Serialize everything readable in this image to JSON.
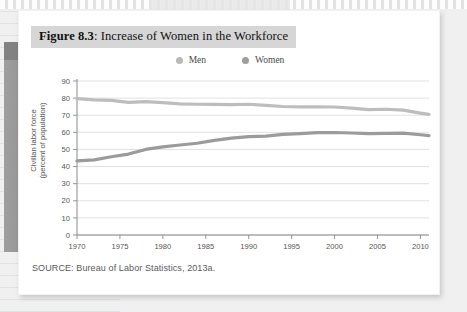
{
  "figure": {
    "number_label": "Figure 8.3",
    "separator": ": ",
    "title_text": "Increase of Women in the Workforce",
    "source": "SOURCE: Bureau of Labor Statistics, 2013a."
  },
  "legend": {
    "items": [
      {
        "label": "Men",
        "color": "#b9b9b9"
      },
      {
        "label": "Women",
        "color": "#9e9e9e"
      }
    ]
  },
  "colors": {
    "title_banner_bg": "#d6d6d6",
    "card_bg": "#ffffff",
    "page_bg": "#f0f0f0",
    "gridline": "#d9d9d9",
    "axis": "#8a8a8a",
    "men_line": "#bdbdbd",
    "women_line": "#9b9b9b"
  },
  "chart_data": {
    "type": "line",
    "title": "Increase of Women in the Workforce",
    "xlabel": "",
    "ylabel": "Civilian labor force (percent of population)",
    "ylabel_line1": "Civilian labor force",
    "ylabel_line2": "(percent of population)",
    "xlim": [
      1970,
      2011
    ],
    "ylim": [
      0,
      90
    ],
    "yticks": [
      0,
      10,
      20,
      30,
      40,
      50,
      60,
      70,
      80,
      90
    ],
    "xticks": [
      1970,
      1975,
      1980,
      1985,
      1990,
      1995,
      2000,
      2005,
      2010
    ],
    "grid": true,
    "legend_position": "top-center",
    "x": [
      1970,
      1972,
      1974,
      1976,
      1978,
      1980,
      1982,
      1984,
      1986,
      1988,
      1990,
      1992,
      1994,
      1996,
      1998,
      2000,
      2002,
      2004,
      2006,
      2008,
      2010,
      2011
    ],
    "series": [
      {
        "name": "Men",
        "color": "#bdbdbd",
        "values": [
          79.7,
          79.0,
          78.7,
          77.5,
          77.9,
          77.4,
          76.6,
          76.4,
          76.3,
          76.2,
          76.4,
          75.8,
          75.1,
          74.9,
          74.9,
          74.8,
          74.1,
          73.3,
          73.5,
          73.0,
          71.2,
          70.5
        ]
      },
      {
        "name": "Women",
        "color": "#9b9b9b",
        "values": [
          43.3,
          43.9,
          45.7,
          47.3,
          50.0,
          51.5,
          52.6,
          53.6,
          55.3,
          56.6,
          57.5,
          57.8,
          58.8,
          59.3,
          59.8,
          59.9,
          59.6,
          59.2,
          59.4,
          59.5,
          58.6,
          58.1
        ]
      }
    ]
  }
}
